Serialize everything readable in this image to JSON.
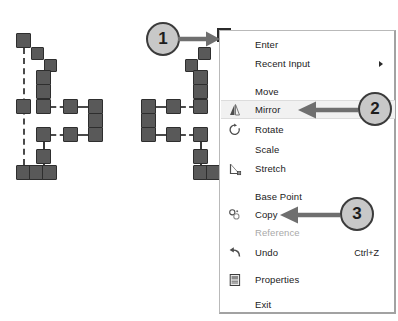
{
  "app": {
    "title": "AutoCAD context menu with mirror operation"
  },
  "context_menu": {
    "name": "right-click-context-menu",
    "items": [
      {
        "id": "enter",
        "label": "Enter",
        "icon": "",
        "shortcut": "",
        "disabled": false,
        "submenu": false,
        "highlight": false,
        "y": 34
      },
      {
        "id": "recent-input",
        "label": "Recent Input",
        "icon": "",
        "shortcut": "",
        "disabled": false,
        "submenu": true,
        "highlight": false,
        "y": 53
      },
      {
        "id": "move",
        "label": "Move",
        "icon": "",
        "shortcut": "",
        "disabled": false,
        "submenu": false,
        "highlight": false,
        "y": 81
      },
      {
        "id": "mirror",
        "label": "Mirror",
        "icon": "mirror-icon",
        "shortcut": "",
        "disabled": false,
        "submenu": false,
        "highlight": true,
        "y": 99
      },
      {
        "id": "rotate",
        "label": "Rotate",
        "icon": "rotate-icon",
        "shortcut": "",
        "disabled": false,
        "submenu": false,
        "highlight": false,
        "y": 119
      },
      {
        "id": "scale",
        "label": "Scale",
        "icon": "",
        "shortcut": "",
        "disabled": false,
        "submenu": false,
        "highlight": false,
        "y": 139
      },
      {
        "id": "stretch",
        "label": "Stretch",
        "icon": "stretch-icon",
        "shortcut": "",
        "disabled": false,
        "submenu": false,
        "highlight": false,
        "y": 158
      },
      {
        "id": "base-point",
        "label": "Base Point",
        "icon": "",
        "shortcut": "",
        "disabled": false,
        "submenu": false,
        "highlight": false,
        "y": 186
      },
      {
        "id": "copy",
        "label": "Copy",
        "icon": "copy-icon",
        "shortcut": "",
        "disabled": false,
        "submenu": false,
        "highlight": false,
        "y": 204
      },
      {
        "id": "reference",
        "label": "Reference",
        "icon": "",
        "shortcut": "",
        "disabled": true,
        "submenu": false,
        "highlight": false,
        "y": 222
      },
      {
        "id": "undo",
        "label": "Undo",
        "icon": "undo-icon",
        "shortcut": "Ctrl+Z",
        "disabled": false,
        "submenu": false,
        "highlight": false,
        "y": 242
      },
      {
        "id": "properties",
        "label": "Properties",
        "icon": "properties-icon",
        "shortcut": "",
        "disabled": false,
        "submenu": false,
        "highlight": false,
        "y": 269
      },
      {
        "id": "exit",
        "label": "Exit",
        "icon": "",
        "shortcut": "",
        "disabled": false,
        "submenu": false,
        "highlight": false,
        "y": 294
      }
    ]
  },
  "callouts": [
    {
      "id": "callout-1",
      "label": "1",
      "x": 146,
      "y": 22,
      "arrow_from_x": 181,
      "arrow_to_x": 215,
      "arrow_y": 39,
      "direction": "right"
    },
    {
      "id": "callout-2",
      "label": "2",
      "x": 358,
      "y": 92,
      "arrow_from_x": 352,
      "arrow_to_x": 300,
      "arrow_y": 109,
      "direction": "left"
    },
    {
      "id": "callout-3",
      "label": "3",
      "x": 340,
      "y": 197,
      "arrow_from_x": 334,
      "arrow_to_x": 282,
      "arrow_y": 214,
      "direction": "left"
    }
  ],
  "drawing": {
    "name": "cad-geometry",
    "mirror_axis": {
      "x": 23,
      "y1": 48,
      "y2": 175
    },
    "colors": {
      "node_fill": "#595959",
      "node_stroke": "#2e2e2e",
      "dash": "#4a4a4a"
    },
    "original_nodes": [
      {
        "x": 16,
        "y": 33
      },
      {
        "x": 31,
        "y": 47
      },
      {
        "x": 44,
        "y": 59
      },
      {
        "x": 36,
        "y": 70
      },
      {
        "x": 36,
        "y": 84
      },
      {
        "x": 36,
        "y": 99
      },
      {
        "x": 16,
        "y": 99
      },
      {
        "x": 63,
        "y": 99
      },
      {
        "x": 88,
        "y": 99
      },
      {
        "x": 88,
        "y": 113
      },
      {
        "x": 88,
        "y": 127
      },
      {
        "x": 63,
        "y": 127
      },
      {
        "x": 36,
        "y": 127
      },
      {
        "x": 36,
        "y": 149
      },
      {
        "x": 16,
        "y": 165
      },
      {
        "x": 29,
        "y": 165
      },
      {
        "x": 42,
        "y": 165
      }
    ],
    "mirrored_nodes": [
      {
        "x": 198,
        "y": 47
      },
      {
        "x": 185,
        "y": 59
      },
      {
        "x": 193,
        "y": 70
      },
      {
        "x": 193,
        "y": 84
      },
      {
        "x": 193,
        "y": 99
      },
      {
        "x": 166,
        "y": 99
      },
      {
        "x": 141,
        "y": 99
      },
      {
        "x": 141,
        "y": 113
      },
      {
        "x": 141,
        "y": 127
      },
      {
        "x": 166,
        "y": 127
      },
      {
        "x": 193,
        "y": 127
      },
      {
        "x": 193,
        "y": 149
      },
      {
        "x": 193,
        "y": 165
      },
      {
        "x": 206,
        "y": 165
      }
    ]
  }
}
